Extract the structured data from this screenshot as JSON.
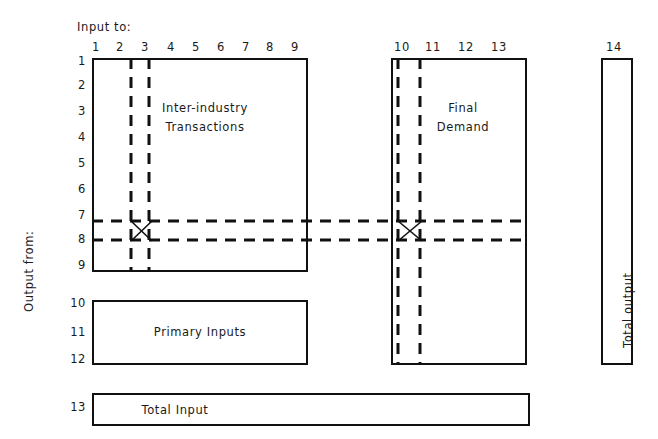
{
  "diagram": {
    "title_top": "Input to:",
    "title_left": "Output from:",
    "column_numbers": [
      "1",
      "2",
      "3",
      "4",
      "5",
      "6",
      "7",
      "8",
      "9",
      "10",
      "11",
      "12",
      "13",
      "14"
    ],
    "row_numbers": [
      "1",
      "2",
      "3",
      "4",
      "5",
      "6",
      "7",
      "8",
      "9",
      "10",
      "11",
      "12",
      "13"
    ],
    "boxes": {
      "inter_industry": "Inter-industry\nTransactions",
      "inter_industry_line1": "Inter-industry",
      "inter_industry_line2": "Transactions",
      "final_demand_line1": "Final",
      "final_demand_line2": "Demand",
      "primary_inputs": "Primary Inputs",
      "total_input": "Total Input",
      "total_output": "Total output"
    },
    "colors": {
      "line": "#111111",
      "text": "#1a1a1a",
      "background": "#ffffff"
    },
    "highlight": {
      "style": "dashed",
      "row_band": [
        "7",
        "8"
      ],
      "column_band_left": [
        "1",
        "2"
      ],
      "column_band_right": [
        "10",
        "11"
      ],
      "marker": "x-cross"
    }
  }
}
